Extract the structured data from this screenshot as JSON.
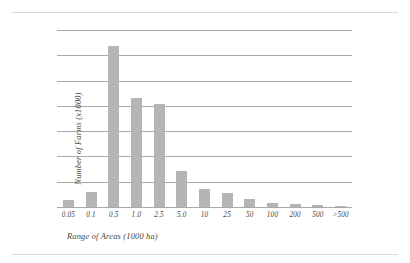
{
  "chart_data": {
    "type": "bar",
    "title": "",
    "subtitle": "",
    "xlabel": "Range of Areas (1000 ha)",
    "ylabel": "Number of Farms (x1000)",
    "categories": [
      "0.05",
      "0.1",
      "0.5",
      "1.0",
      "2.5",
      "5.0",
      "10",
      "25",
      "50",
      "100",
      "200",
      "500",
      ">500"
    ],
    "values": [
      1.1,
      2.4,
      25.5,
      17.2,
      16.3,
      5.7,
      2.9,
      2.2,
      1.3,
      0.6,
      0.4,
      0.25,
      0.1
    ],
    "series": [
      {
        "name": "Number of Farms",
        "values": [
          1.1,
          2.4,
          25.5,
          17.2,
          16.3,
          5.7,
          2.9,
          2.2,
          1.3,
          0.6,
          0.4,
          0.25,
          0.1
        ]
      }
    ],
    "ylim": [
      0,
      28
    ],
    "xlim_type": "categorical",
    "yticks": [
      0,
      4,
      8,
      12,
      16,
      20,
      24,
      28
    ],
    "ytick_labels": [
      "0",
      "4",
      "8",
      "12",
      "16",
      "20",
      "24",
      "28"
    ],
    "grid": "horizontal",
    "legend": "none",
    "bar_color": "#b5b5b5",
    "gridline_color": "#a9a9a9",
    "text_color": "#3f3f3f",
    "background": "#ffffff"
  },
  "figure": {
    "top_rule": "",
    "bottom_rule": ""
  }
}
